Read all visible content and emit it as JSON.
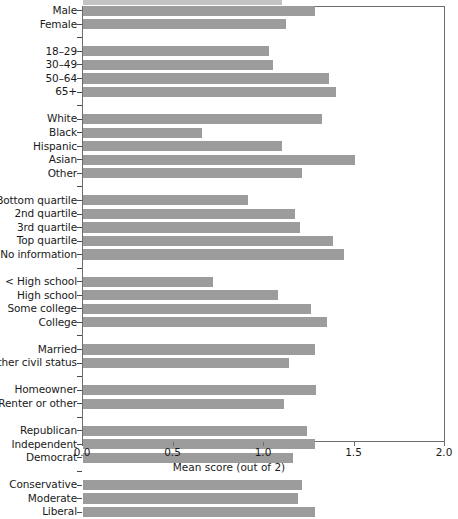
{
  "chart_data": {
    "type": "bar",
    "orientation": "horizontal",
    "title": "",
    "xlabel": "Mean score (out of 2)",
    "ylabel": "",
    "xlim": [
      0,
      2
    ],
    "xticks": [
      0.0,
      0.5,
      1.0,
      1.5,
      2.0
    ],
    "xtick_labels": [
      "0.0",
      "0.5",
      "1.0",
      "1.5",
      "2.0"
    ],
    "grid": false,
    "legend": false,
    "bar_color": "#9c9c9c",
    "frame_color": "#6d6d6d",
    "categories": [
      "Male",
      "Female",
      "18–29",
      "30–49",
      "50–64",
      "65+",
      "White",
      "Black",
      "Hispanic",
      "Asian",
      "Other",
      "Bottom quartile",
      "2nd quartile",
      "3rd quartile",
      "Top quartile",
      "No information",
      "< High school",
      "High school",
      "Some college",
      "College",
      "Married",
      "Other civil status",
      "Homeowner",
      "Renter or other",
      "Republican",
      "Independent",
      "Democrat",
      "Conservative",
      "Moderate",
      "Liberal"
    ],
    "values": [
      1.28,
      1.12,
      1.03,
      1.05,
      1.36,
      1.4,
      1.32,
      0.66,
      1.1,
      1.5,
      1.21,
      0.91,
      1.17,
      1.2,
      1.38,
      1.44,
      0.72,
      1.08,
      1.26,
      1.35,
      1.28,
      1.14,
      1.29,
      1.11,
      1.24,
      1.28,
      1.16,
      1.21,
      1.19,
      1.28
    ],
    "groups": [
      {
        "name": "Sex",
        "categories": [
          "Male",
          "Female"
        ],
        "values": [
          1.28,
          1.12
        ]
      },
      {
        "name": "Age",
        "categories": [
          "18–29",
          "30–49",
          "50–64",
          "65+"
        ],
        "values": [
          1.03,
          1.05,
          1.36,
          1.4
        ]
      },
      {
        "name": "Race/ethnicity",
        "categories": [
          "White",
          "Black",
          "Hispanic",
          "Asian",
          "Other"
        ],
        "values": [
          1.32,
          0.66,
          1.1,
          1.5,
          1.21
        ]
      },
      {
        "name": "Income",
        "categories": [
          "Bottom quartile",
          "2nd quartile",
          "3rd quartile",
          "Top quartile",
          "No information"
        ],
        "values": [
          0.91,
          1.17,
          1.2,
          1.38,
          1.44
        ]
      },
      {
        "name": "Education",
        "categories": [
          "< High school",
          "High school",
          "Some college",
          "College"
        ],
        "values": [
          0.72,
          1.08,
          1.26,
          1.35
        ]
      },
      {
        "name": "Marital status",
        "categories": [
          "Married",
          "Other civil status"
        ],
        "values": [
          1.28,
          1.14
        ]
      },
      {
        "name": "Housing",
        "categories": [
          "Homeowner",
          "Renter or other"
        ],
        "values": [
          1.29,
          1.11
        ]
      },
      {
        "name": "Party",
        "categories": [
          "Republican",
          "Independent",
          "Democrat"
        ],
        "values": [
          1.24,
          1.28,
          1.16
        ]
      },
      {
        "name": "Ideology",
        "categories": [
          "Conservative",
          "Moderate",
          "Liberal"
        ],
        "values": [
          1.21,
          1.19,
          1.28
        ]
      }
    ]
  }
}
